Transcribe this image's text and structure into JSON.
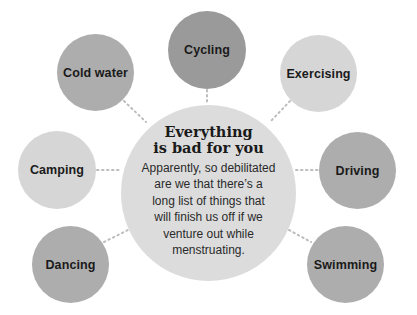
{
  "center": {
    "title_line1": "Everything",
    "title_line2": "is bad for you",
    "body_lines": [
      "Apparently, so debilitated",
      "are we that there’s a",
      "long list of things that",
      "will finish us off if we",
      "venture out while",
      "menstruating."
    ],
    "color": "#dcdcdc"
  },
  "bubbles": [
    {
      "label": "Cycling",
      "color": "#9a9a9a"
    },
    {
      "label": "Cold water",
      "color": "#adadad"
    },
    {
      "label": "Exercising",
      "color": "#d6d6d6"
    },
    {
      "label": "Camping",
      "color": "#d6d6d6"
    },
    {
      "label": "Driving",
      "color": "#adadad"
    },
    {
      "label": "Dancing",
      "color": "#adadad"
    },
    {
      "label": "Swimming",
      "color": "#adadad"
    }
  ]
}
